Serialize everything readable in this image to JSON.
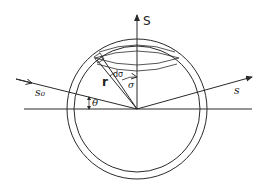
{
  "figure": {
    "type": "scattering-geometry-diagram",
    "labels": {
      "polar_axis": "S",
      "incident_ray": "s₀",
      "scattered_ray": "s",
      "radius": "r",
      "ring_element": "dσ",
      "polar_angle": "σ",
      "scattering_angle": "θ"
    },
    "line_color": "#2a2a2a",
    "background": "#ffffff"
  }
}
